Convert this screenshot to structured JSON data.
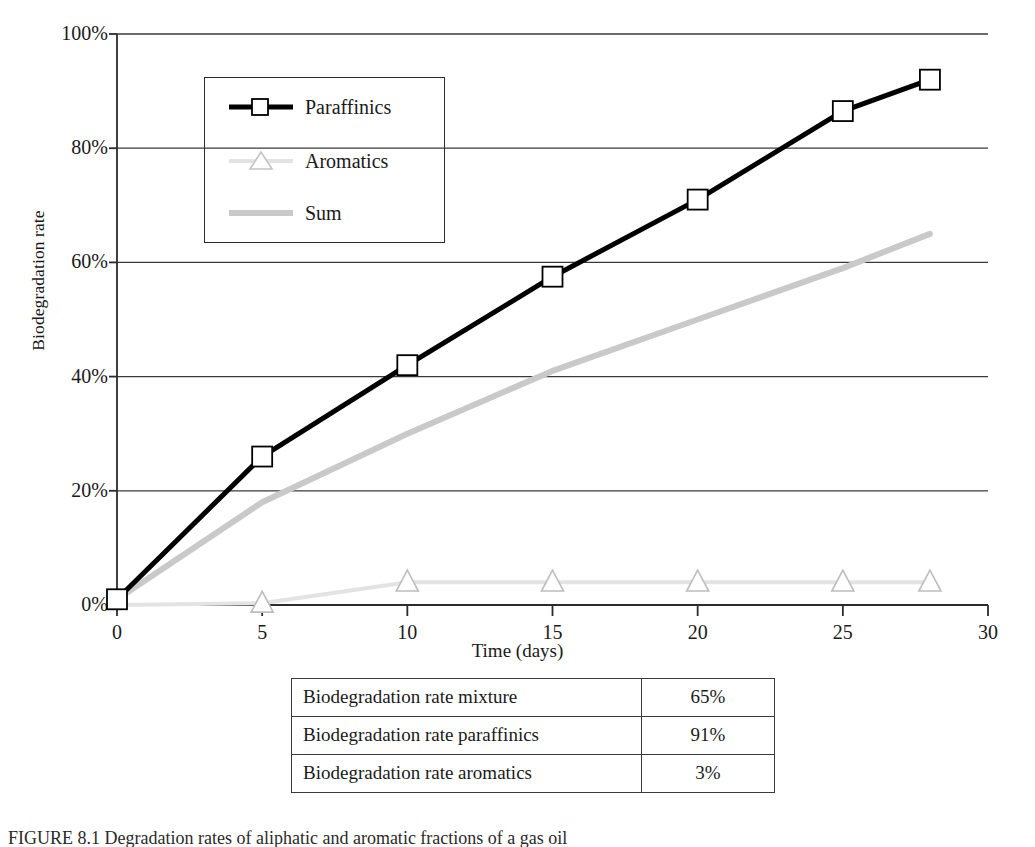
{
  "figure": {
    "caption": "FIGURE 8.1  Degradation rates of aliphatic and aromatic fractions of a gas oil"
  },
  "chart_data": {
    "type": "line",
    "title": "",
    "xlabel": "Time (days)",
    "ylabel": "Biodegradation rate",
    "xlim": [
      0,
      30
    ],
    "ylim": [
      0,
      100
    ],
    "xticks": [
      "0",
      "5",
      "10",
      "15",
      "20",
      "25",
      "30"
    ],
    "xtick_values": [
      0,
      5,
      10,
      15,
      20,
      25,
      30
    ],
    "yticks": [
      "0%",
      "20%",
      "40%",
      "60%",
      "80%",
      "100%"
    ],
    "ytick_values": [
      0,
      20,
      40,
      60,
      80,
      100
    ],
    "grid": "horizontal",
    "legend_position": "upper-left-inside",
    "series": [
      {
        "name": "Paraffinics",
        "color": "#000000",
        "marker": "square",
        "marker_face": "#ffffff",
        "line_width": 5,
        "x": [
          0,
          5,
          10,
          15,
          20,
          25,
          28
        ],
        "values": [
          1,
          26,
          42,
          57.5,
          71,
          86.5,
          92
        ]
      },
      {
        "name": "Aromatics",
        "color": "#e3e3e3",
        "marker": "triangle",
        "marker_face": "#ffffff",
        "line_width": 4,
        "x": [
          0,
          5,
          10,
          15,
          20,
          25,
          28
        ],
        "values": [
          0,
          0.3,
          4,
          4,
          4,
          4,
          4
        ]
      },
      {
        "name": "Sum",
        "color": "#c9c9c9",
        "marker": "none",
        "marker_face": "#ffffff",
        "line_width": 6,
        "x": [
          0,
          5,
          10,
          15,
          20,
          25,
          28
        ],
        "values": [
          1,
          18,
          30,
          41,
          50,
          59,
          65
        ]
      }
    ]
  },
  "table": {
    "rows": [
      {
        "label": "Biodegradation rate mixture",
        "value": "65%"
      },
      {
        "label": "Biodegradation rate paraffinics",
        "value": "91%"
      },
      {
        "label": "Biodegradation rate aromatics",
        "value": "3%"
      }
    ]
  },
  "colors": {
    "axis": "#2b2b2b",
    "grid": "#3a3a3a",
    "paraffinics": "#000000",
    "aromatics": "#e3e3e3",
    "sum": "#c9c9c9",
    "table_border": "#3a3a3a"
  }
}
